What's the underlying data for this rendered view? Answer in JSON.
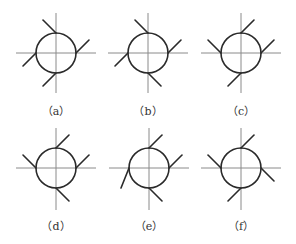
{
  "figure": {
    "panels": [
      {
        "id": "a",
        "label": "（a）",
        "cx": 56,
        "cy": 53,
        "ticks": {
          "top": "up-left",
          "right": "up-right",
          "left": "down-left",
          "bottom": "down-left"
        }
      },
      {
        "id": "b",
        "label": "（b）",
        "cx": 148,
        "cy": 53,
        "ticks": {
          "top": "up-left",
          "right": "up-right",
          "left": "down-left",
          "bottom": "down-right"
        }
      },
      {
        "id": "c",
        "label": "（c）",
        "cx": 241,
        "cy": 53,
        "ticks": {
          "top": "up-right",
          "right": "up-right",
          "left": "up-left",
          "bottom": "down-left"
        }
      },
      {
        "id": "d",
        "label": "（d）",
        "cx": 56,
        "cy": 168,
        "ticks": {
          "top": "up-right",
          "right": "up-right",
          "left": "up-left",
          "bottom": "down-right"
        }
      },
      {
        "id": "e",
        "label": "（e）",
        "cx": 149,
        "cy": 168,
        "ticks": {
          "top": "up-right",
          "right": "up-right",
          "left": "down-left-steep",
          "bottom": "down-right"
        }
      },
      {
        "id": "f",
        "label": "（f）",
        "cx": 241,
        "cy": 168,
        "ticks": {
          "top": "up-right",
          "right": "down-right",
          "left": "up-left",
          "bottom": "down-left"
        }
      }
    ],
    "radius": 20,
    "axis_half_length": 40,
    "tick_length": 18
  }
}
